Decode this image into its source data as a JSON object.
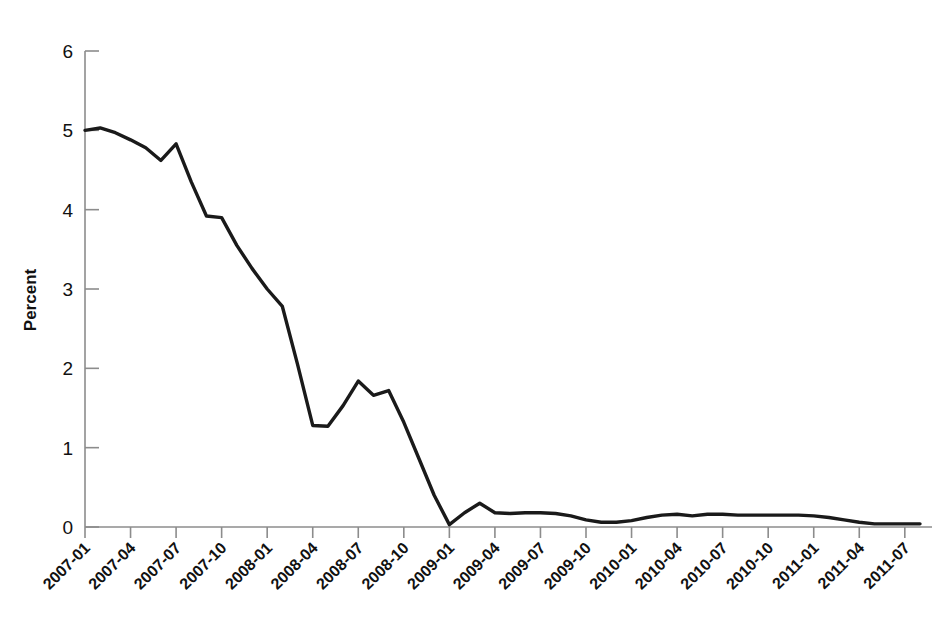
{
  "chart_data": {
    "type": "line",
    "title": "",
    "xlabel": "",
    "ylabel": "Percent",
    "ylim": [
      0,
      6
    ],
    "yticks": [
      0,
      1,
      2,
      3,
      4,
      5,
      6
    ],
    "ytick_labels": [
      "0",
      "1",
      "2",
      "3",
      "4",
      "5",
      "6"
    ],
    "grid": false,
    "legend": "none",
    "line_color": "#1a1a1a",
    "axis_color": "#8c8c8c",
    "xtick_labels": [
      "2007-01",
      "2007-04",
      "2007-07",
      "2007-10",
      "2008-01",
      "2008-04",
      "2008-07",
      "2008-10",
      "2009-01",
      "2009-04",
      "2009-07",
      "2009-10",
      "2010-01",
      "2010-04",
      "2010-07",
      "2010-10",
      "2011-01",
      "2011-04",
      "2011-07"
    ],
    "xtick_rotation_deg": -45,
    "x": [
      "2007-01",
      "2007-02",
      "2007-03",
      "2007-04",
      "2007-05",
      "2007-06",
      "2007-07",
      "2007-08",
      "2007-09",
      "2007-10",
      "2007-11",
      "2007-12",
      "2008-01",
      "2008-02",
      "2008-03",
      "2008-04",
      "2008-05",
      "2008-06",
      "2008-07",
      "2008-08",
      "2008-09",
      "2008-10",
      "2008-11",
      "2008-12",
      "2009-01",
      "2009-02",
      "2009-03",
      "2009-04",
      "2009-05",
      "2009-06",
      "2009-07",
      "2009-08",
      "2009-09",
      "2009-10",
      "2009-11",
      "2009-12",
      "2010-01",
      "2010-02",
      "2010-03",
      "2010-04",
      "2010-05",
      "2010-06",
      "2010-07",
      "2010-08",
      "2010-09",
      "2010-10",
      "2010-11",
      "2010-12",
      "2011-01",
      "2011-02",
      "2011-03",
      "2011-04",
      "2011-05",
      "2011-06",
      "2011-07",
      "2011-08"
    ],
    "values": [
      5.0,
      5.03,
      4.97,
      4.88,
      4.78,
      4.62,
      4.83,
      4.35,
      3.92,
      3.9,
      3.55,
      3.26,
      3.0,
      2.78,
      2.05,
      1.28,
      1.27,
      1.53,
      1.84,
      1.66,
      1.72,
      1.32,
      0.86,
      0.4,
      0.03,
      0.18,
      0.3,
      0.18,
      0.17,
      0.18,
      0.18,
      0.17,
      0.14,
      0.09,
      0.06,
      0.06,
      0.08,
      0.12,
      0.15,
      0.16,
      0.14,
      0.16,
      0.16,
      0.15,
      0.15,
      0.15,
      0.15,
      0.15,
      0.14,
      0.12,
      0.09,
      0.06,
      0.04,
      0.04,
      0.04,
      0.04
    ],
    "series": [
      {
        "name": "Percent",
        "values": [
          5.0,
          5.03,
          4.97,
          4.88,
          4.78,
          4.62,
          4.83,
          4.35,
          3.92,
          3.9,
          3.55,
          3.26,
          3.0,
          2.78,
          2.05,
          1.28,
          1.27,
          1.53,
          1.84,
          1.66,
          1.72,
          1.32,
          0.86,
          0.4,
          0.03,
          0.18,
          0.3,
          0.18,
          0.17,
          0.18,
          0.18,
          0.17,
          0.14,
          0.09,
          0.06,
          0.06,
          0.08,
          0.12,
          0.15,
          0.16,
          0.14,
          0.16,
          0.16,
          0.15,
          0.15,
          0.15,
          0.15,
          0.15,
          0.14,
          0.12,
          0.09,
          0.06,
          0.04,
          0.04,
          0.04,
          0.04
        ]
      }
    ]
  }
}
